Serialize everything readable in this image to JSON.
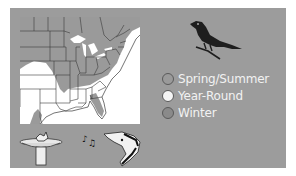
{
  "legend": {
    "items": [
      {
        "label": "Spring/Summer",
        "color": "#9a9a9a"
      },
      {
        "label": "Year-Round",
        "color": "#f4f4f4"
      },
      {
        "label": "Winter",
        "color": "#8a8a8a"
      }
    ]
  },
  "colors": {
    "panel": "#9c9c9c",
    "map_year_round": "#ffffff",
    "map_spring_summer": "#9a9a9a",
    "bird": "#1e1e1e",
    "legend_text": "#f2f2f2"
  },
  "icons": {
    "bird": "bird-silhouette-icon",
    "birdbath": "birdbath-icon",
    "song": "singing-bird-icon"
  }
}
